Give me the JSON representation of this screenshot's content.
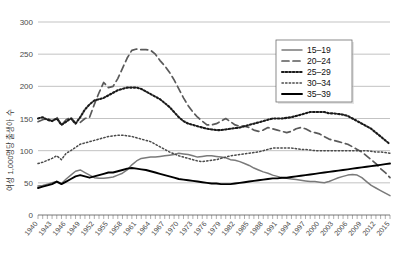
{
  "chart_data": {
    "type": "line",
    "title": "",
    "xlabel": "",
    "ylabel": "여성 1,000명당 출생아 수",
    "xlim": [
      1940,
      2015
    ],
    "ylim": [
      0,
      300
    ],
    "yticks": [
      0,
      50,
      100,
      150,
      200,
      250,
      300
    ],
    "xticks": [
      1940,
      1943,
      1946,
      1949,
      1952,
      1955,
      1958,
      1961,
      1964,
      1967,
      1970,
      1973,
      1976,
      1979,
      1982,
      1985,
      1988,
      1991,
      1994,
      1997,
      2000,
      2003,
      2006,
      2009,
      2012,
      2015
    ],
    "grid": true,
    "legend_position": "top-right",
    "x": [
      1940,
      1941,
      1942,
      1943,
      1944,
      1945,
      1946,
      1947,
      1948,
      1949,
      1950,
      1951,
      1952,
      1953,
      1954,
      1955,
      1956,
      1957,
      1958,
      1959,
      1960,
      1961,
      1962,
      1963,
      1964,
      1965,
      1966,
      1967,
      1968,
      1969,
      1970,
      1971,
      1972,
      1973,
      1974,
      1975,
      1976,
      1977,
      1978,
      1979,
      1980,
      1981,
      1982,
      1983,
      1984,
      1985,
      1986,
      1987,
      1988,
      1989,
      1990,
      1991,
      1992,
      1993,
      1994,
      1995,
      1996,
      1997,
      1998,
      1999,
      2000,
      2001,
      2002,
      2003,
      2004,
      2005,
      2006,
      2007,
      2008,
      2009,
      2010,
      2011,
      2012,
      2013,
      2014,
      2015
    ],
    "series": [
      {
        "name": "15-19",
        "style": "solid-gray",
        "color": "#7a7a7a",
        "values": [
          45,
          46,
          48,
          50,
          52,
          49,
          56,
          62,
          68,
          70,
          66,
          62,
          58,
          57,
          57,
          58,
          59,
          62,
          65,
          70,
          78,
          84,
          88,
          89,
          90,
          90,
          91,
          92,
          93,
          94,
          96,
          95,
          94,
          92,
          90,
          91,
          92,
          92,
          91,
          90,
          89,
          86,
          85,
          83,
          80,
          77,
          73,
          70,
          67,
          65,
          62,
          60,
          58,
          57,
          56,
          55,
          54,
          53,
          52,
          52,
          51,
          50,
          52,
          55,
          58,
          60,
          62,
          63,
          62,
          58,
          52,
          46,
          42,
          38,
          34,
          30
        ]
      },
      {
        "name": "20-24",
        "style": "dashed",
        "color": "#5a5a5a",
        "values": [
          145,
          148,
          150,
          146,
          152,
          140,
          148,
          152,
          143,
          144,
          150,
          152,
          172,
          190,
          206,
          198,
          200,
          212,
          228,
          244,
          256,
          258,
          257,
          257,
          256,
          250,
          240,
          232,
          222,
          210,
          196,
          182,
          170,
          160,
          152,
          146,
          140,
          140,
          142,
          146,
          150,
          145,
          140,
          138,
          138,
          136,
          132,
          130,
          132,
          136,
          134,
          132,
          130,
          128,
          130,
          134,
          136,
          134,
          130,
          128,
          126,
          122,
          118,
          116,
          114,
          112,
          110,
          106,
          102,
          98,
          92,
          86,
          80,
          72,
          66,
          58
        ]
      },
      {
        "name": "25-29",
        "style": "dotted-heavy",
        "color": "#1a1a1a",
        "values": [
          150,
          152,
          148,
          146,
          150,
          140,
          145,
          150,
          142,
          152,
          164,
          172,
          178,
          180,
          182,
          186,
          190,
          194,
          196,
          198,
          198,
          198,
          196,
          192,
          188,
          184,
          180,
          174,
          168,
          160,
          152,
          146,
          142,
          140,
          138,
          136,
          134,
          133,
          132,
          132,
          133,
          134,
          135,
          136,
          138,
          140,
          142,
          144,
          146,
          148,
          150,
          150,
          150,
          151,
          152,
          154,
          156,
          158,
          160,
          160,
          160,
          160,
          158,
          158,
          157,
          156,
          154,
          150,
          146,
          142,
          138,
          134,
          128,
          122,
          116,
          110
        ]
      },
      {
        "name": "30-34",
        "style": "dotted-light",
        "color": "#4a4a4a",
        "values": [
          80,
          82,
          85,
          88,
          92,
          86,
          96,
          100,
          105,
          110,
          112,
          114,
          116,
          118,
          120,
          122,
          123,
          124,
          124,
          123,
          122,
          120,
          118,
          116,
          114,
          110,
          106,
          102,
          98,
          95,
          92,
          90,
          88,
          86,
          84,
          83,
          84,
          85,
          86,
          88,
          90,
          92,
          93,
          94,
          95,
          96,
          97,
          98,
          100,
          102,
          104,
          104,
          104,
          104,
          104,
          103,
          102,
          102,
          101,
          100,
          100,
          100,
          100,
          100,
          100,
          100,
          100,
          100,
          100,
          100,
          100,
          99,
          98,
          98,
          97,
          96
        ]
      },
      {
        "name": "35-39",
        "style": "solid-black",
        "color": "#000000",
        "values": [
          42,
          44,
          46,
          48,
          52,
          48,
          52,
          56,
          60,
          62,
          60,
          58,
          60,
          62,
          64,
          66,
          66,
          68,
          70,
          72,
          73,
          72,
          71,
          70,
          68,
          66,
          64,
          62,
          60,
          58,
          56,
          55,
          54,
          53,
          52,
          51,
          50,
          49,
          49,
          48,
          48,
          48,
          49,
          50,
          51,
          52,
          53,
          54,
          55,
          56,
          57,
          57,
          58,
          58,
          59,
          60,
          61,
          62,
          63,
          64,
          65,
          66,
          67,
          68,
          69,
          70,
          71,
          72,
          73,
          74,
          75,
          76,
          77,
          78,
          79,
          80
        ]
      }
    ]
  },
  "legend": {
    "items": [
      {
        "label": "15–19"
      },
      {
        "label": "20–24"
      },
      {
        "label": "25–29"
      },
      {
        "label": "30–34"
      },
      {
        "label": "35–39"
      }
    ]
  },
  "colors": {
    "grid": "#9a9a9a",
    "axis": "#555555",
    "background": "#ffffff"
  }
}
